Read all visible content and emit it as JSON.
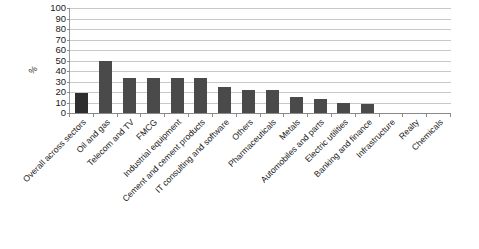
{
  "chart_data": {
    "type": "bar",
    "title": "",
    "subtitle": "",
    "xlabel": "",
    "ylabel": "%",
    "ylim": [
      0,
      100
    ],
    "ytick_step": 10,
    "yticks": [
      100,
      90,
      80,
      70,
      60,
      50,
      40,
      30,
      20,
      10,
      0
    ],
    "grid": true,
    "legend": "none",
    "orientation": "vertical",
    "bar_color": "#4a4a4a",
    "first_bar_color": "#2e2e2e",
    "gridline_color": "#c9c9c9",
    "axis_color": "#8a8a8a",
    "label_rotation_deg": -45,
    "categories": [
      "Overall across sectors",
      "Oil and gas",
      "Telecom and TV",
      "FMCG",
      "Industrial equipment",
      "Cement and cement products",
      "IT consulting and software",
      "Others",
      "Pharmaceuticals",
      "Metals",
      "Automobiles and parts",
      "Electric utilities",
      "Banking and finance",
      "Infrastructure",
      "Realty",
      "Chemicals"
    ],
    "values": [
      19,
      50,
      33,
      33,
      33,
      33,
      25,
      22,
      22,
      15,
      13,
      10,
      9,
      0,
      0,
      0
    ]
  }
}
